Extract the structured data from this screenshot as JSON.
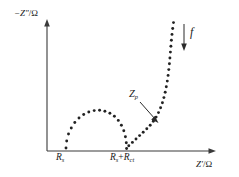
{
  "chart_data": {
    "type": "scatter",
    "title": "",
    "subtitle": "",
    "xlabel": "Z'/Ω",
    "ylabel": "−Z\"/Ω",
    "xlabel_parts": {
      "symbol": "Z",
      "prime": "′",
      "unit": "Ω"
    },
    "ylabel_parts": {
      "sign": "−",
      "symbol": "Z",
      "prime": "″",
      "unit": "Ω"
    },
    "grid": false,
    "legend": null,
    "axis_style": "arrow-headed open axes, no numeric ticks",
    "xlim": [
      0,
      1
    ],
    "ylim": [
      0,
      1
    ],
    "tick_labels": {
      "x": [
        {
          "id": "Rs",
          "text_main": "R",
          "text_sub": "s",
          "x_px": 66
        },
        {
          "id": "Rs+Rct",
          "text_main_1": "R",
          "text_sub_1": "s",
          "plus": "+",
          "text_main_2": "R",
          "text_sub_2": "ct",
          "x_px": 127
        }
      ],
      "y": []
    },
    "annotations": [
      {
        "id": "Zp",
        "text_main": "Z",
        "text_sub": "p",
        "meaning": "polarization impedance pointer",
        "arrow": "diagonal arrow to Warburg branch"
      },
      {
        "id": "f",
        "text_main": "f",
        "meaning": "decreasing frequency direction",
        "arrow": "downward vertical arrow"
      }
    ],
    "series": [
      {
        "name": "impedance-semicircle",
        "description": "depressed semicircle from Rs to Rs+Rct (charge transfer arc)",
        "marker": "dot",
        "points_px": [
          [
            66,
            148
          ],
          [
            66.7,
            141
          ],
          [
            68.5,
            134
          ],
          [
            71.3,
            128
          ],
          [
            74.8,
            122.5
          ],
          [
            79,
            118
          ],
          [
            83.7,
            114.5
          ],
          [
            88.8,
            112
          ],
          [
            94.2,
            110.6
          ],
          [
            99.6,
            110.3
          ],
          [
            104.9,
            111.2
          ],
          [
            109.9,
            113.2
          ],
          [
            114.4,
            116.3
          ],
          [
            118.3,
            120.4
          ],
          [
            121.4,
            125.3
          ],
          [
            123.8,
            130.8
          ],
          [
            125.4,
            136.7
          ],
          [
            126.3,
            142.7
          ],
          [
            126.6,
            148.5
          ]
        ]
      },
      {
        "name": "warburg-tail",
        "description": "rising diffusion branch curving to near-vertical at low frequency",
        "marker": "dot",
        "points_px": [
          [
            128.8,
            145.8
          ],
          [
            132.4,
            142.4
          ],
          [
            136.0,
            139.0
          ],
          [
            139.6,
            135.6
          ],
          [
            143.2,
            132.2
          ],
          [
            146.8,
            128.8
          ],
          [
            150.2,
            125.2
          ],
          [
            153.3,
            121.3
          ],
          [
            156.1,
            117.1
          ],
          [
            158.5,
            112.6
          ],
          [
            160.6,
            107.8
          ],
          [
            162.4,
            102.8
          ],
          [
            163.9,
            97.6
          ],
          [
            165.2,
            92.2
          ],
          [
            166.3,
            86.7
          ],
          [
            167.3,
            81.1
          ],
          [
            168.1,
            75.4
          ],
          [
            168.8,
            69.6
          ],
          [
            169.4,
            63.8
          ],
          [
            169.9,
            58.0
          ],
          [
            170.4,
            52.1
          ],
          [
            170.9,
            46.2
          ],
          [
            171.4,
            40.3
          ],
          [
            172.0,
            34.4
          ],
          [
            172.7,
            28.5
          ],
          [
            173.5,
            22.6
          ]
        ]
      }
    ],
    "colors": {
      "marker": "#222222",
      "axis": "#3a3a3a",
      "text": "#1a1a1a",
      "background": "#ffffff"
    }
  }
}
